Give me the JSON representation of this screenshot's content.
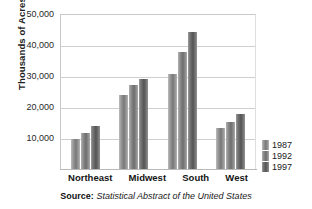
{
  "chart_data": {
    "type": "bar",
    "title": "",
    "xlabel": "",
    "ylabel": "Thousands of Acres",
    "ylim": [
      0,
      50000
    ],
    "yticks": [
      "10,000",
      "20,000",
      "30,000",
      "40,000",
      "50,000"
    ],
    "ytick_values": [
      10000,
      20000,
      30000,
      40000,
      50000
    ],
    "grid": true,
    "legend_position": "right",
    "categories": [
      "Northeast",
      "Midwest",
      "South",
      "West"
    ],
    "series": [
      {
        "name": "1987",
        "color": "#8a8a8a",
        "values": [
          9700,
          23800,
          30600,
          13200
        ]
      },
      {
        "name": "1992",
        "color": "#7d7d7d",
        "values": [
          11600,
          27000,
          37600,
          15100
        ]
      },
      {
        "name": "1997",
        "color": "#5e5e5e",
        "values": [
          13900,
          28900,
          44200,
          17800
        ]
      }
    ]
  },
  "source": {
    "label": "Source:",
    "title": "Statistical Abstract of the United States"
  }
}
